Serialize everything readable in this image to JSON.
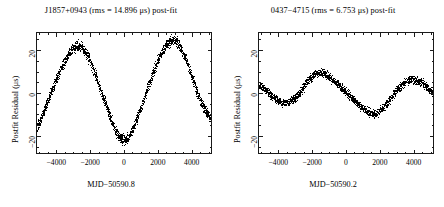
{
  "figure": {
    "background": "#ffffff",
    "ink_color": "#000000",
    "panel_count": 2
  },
  "chart_data": [
    {
      "type": "line",
      "panel": "left",
      "title": "J1857+0943 (rms = 14.896 μs) post-fit",
      "pulsar": "J1857+0943",
      "rms_value": 14.896,
      "rms_units": "μs",
      "fit_stage": "post-fit",
      "xlabel": "MJD−50590.8",
      "ylabel": "Postfit Residual (μs)",
      "xlim": [
        -5200,
        5200
      ],
      "ylim": [
        -28.5,
        28.5
      ],
      "xticks": [
        -4000,
        -2000,
        0,
        2000,
        4000
      ],
      "xtick_labels": [
        "−4000",
        "−2000",
        "0",
        "2000",
        "4000"
      ],
      "yticks": [
        -20,
        0,
        20
      ],
      "ytick_labels": [
        "−20",
        "0",
        "20"
      ],
      "xminor_interval": 500,
      "yminor_interval": 5,
      "grid": false,
      "legend": null,
      "marker": "dense-points",
      "scatter_band_halfwidth": 2.0,
      "x": [
        -5200,
        -5000,
        -4800,
        -4600,
        -4400,
        -4200,
        -4000,
        -3800,
        -3600,
        -3400,
        -3200,
        -3000,
        -2800,
        -2600,
        -2400,
        -2200,
        -2000,
        -1800,
        -1600,
        -1400,
        -1200,
        -1000,
        -800,
        -600,
        -400,
        -200,
        0,
        200,
        400,
        600,
        800,
        1000,
        1200,
        1400,
        1600,
        1800,
        2000,
        2200,
        2400,
        2600,
        2800,
        3000,
        3200,
        3400,
        3600,
        3800,
        4000,
        4200,
        4400,
        4600,
        4800,
        5000,
        5200
      ],
      "y": [
        -16.0,
        -12.5,
        -8.5,
        -4.5,
        -0.5,
        3.5,
        7.5,
        11.0,
        14.5,
        17.5,
        20.0,
        21.5,
        22.3,
        22.0,
        20.5,
        18.0,
        14.5,
        10.5,
        6.0,
        1.5,
        -3.0,
        -7.5,
        -12.0,
        -16.0,
        -19.5,
        -21.8,
        -22.3,
        -21.5,
        -19.0,
        -15.5,
        -11.5,
        -7.0,
        -2.5,
        2.0,
        6.5,
        11.0,
        15.0,
        18.5,
        21.5,
        23.5,
        24.6,
        24.8,
        23.5,
        21.0,
        17.5,
        13.5,
        9.0,
        4.5,
        0.0,
        -4.0,
        -7.5,
        -10.0,
        -11.5
      ]
    },
    {
      "type": "line",
      "panel": "right",
      "title": "0437−4715 (rms = 6.753 μs) post-fit",
      "pulsar": "0437−4715",
      "rms_value": 6.753,
      "rms_units": "μs",
      "fit_stage": "post-fit",
      "xlabel": "MJD−50590.2",
      "ylabel": "Postfit Residual (μs)",
      "xlim": [
        -5200,
        5200
      ],
      "ylim": [
        -28.5,
        28.5
      ],
      "xticks": [
        -4000,
        -2000,
        0,
        2000,
        4000
      ],
      "xtick_labels": [
        "−4000",
        "−2000",
        "0",
        "2000",
        "4000"
      ],
      "yticks": [
        -20,
        0,
        20
      ],
      "ytick_labels": [
        "−20",
        "0",
        "20"
      ],
      "xminor_interval": 500,
      "yminor_interval": 5,
      "grid": false,
      "legend": null,
      "marker": "dense-points",
      "scatter_band_halfwidth": 1.6,
      "x": [
        -5200,
        -5000,
        -4800,
        -4600,
        -4400,
        -4200,
        -4000,
        -3800,
        -3600,
        -3400,
        -3200,
        -3000,
        -2800,
        -2600,
        -2400,
        -2200,
        -2000,
        -1800,
        -1600,
        -1400,
        -1200,
        -1000,
        -800,
        -600,
        -400,
        -200,
        0,
        200,
        400,
        600,
        800,
        1000,
        1200,
        1400,
        1600,
        1800,
        2000,
        2200,
        2400,
        2600,
        2800,
        3000,
        3200,
        3400,
        3600,
        3800,
        4000,
        4200,
        4400,
        4600,
        4800,
        5000,
        5200
      ],
      "y": [
        3.5,
        3.0,
        1.5,
        0.0,
        -1.5,
        -3.0,
        -4.0,
        -4.5,
        -4.6,
        -4.2,
        -3.2,
        -1.8,
        0.0,
        2.2,
        4.5,
        6.5,
        8.2,
        9.3,
        9.8,
        9.6,
        8.8,
        7.6,
        6.2,
        4.8,
        3.4,
        2.0,
        0.6,
        -1.0,
        -2.6,
        -4.2,
        -5.8,
        -7.2,
        -8.4,
        -9.2,
        -9.6,
        -9.3,
        -8.4,
        -6.9,
        -5.0,
        -3.0,
        -1.0,
        1.0,
        2.8,
        4.3,
        5.4,
        6.1,
        6.4,
        6.2,
        5.6,
        4.6,
        3.2,
        1.6,
        0.2
      ]
    }
  ],
  "panels": {
    "left": {
      "title_pulsar": "J1857+0943",
      "title_rms": "(rms = 14.896 μs)",
      "title_suffix": "post-fit",
      "title_full": "J1857+0943 (rms = 14.896 μs) post-fit",
      "xlabel": "MJD−50590.8",
      "ylabel": "Postfit Residual (μs)",
      "xtick_labels": [
        "−4000",
        "−2000",
        "0",
        "2000",
        "4000"
      ],
      "ytick_labels": [
        "20",
        "0",
        "−20"
      ]
    },
    "right": {
      "title_pulsar": "0437−4715",
      "title_rms": "(rms = 6.753 μs)",
      "title_suffix": "post-fit",
      "title_full": "0437−4715 (rms = 6.753 μs) post-fit",
      "xlabel": "MJD−50590.2",
      "ylabel": "Postfit Residual (μs)",
      "xtick_labels": [
        "−4000",
        "−2000",
        "0",
        "2000",
        "4000"
      ],
      "ytick_labels": [
        "20",
        "0",
        "−20"
      ]
    }
  }
}
